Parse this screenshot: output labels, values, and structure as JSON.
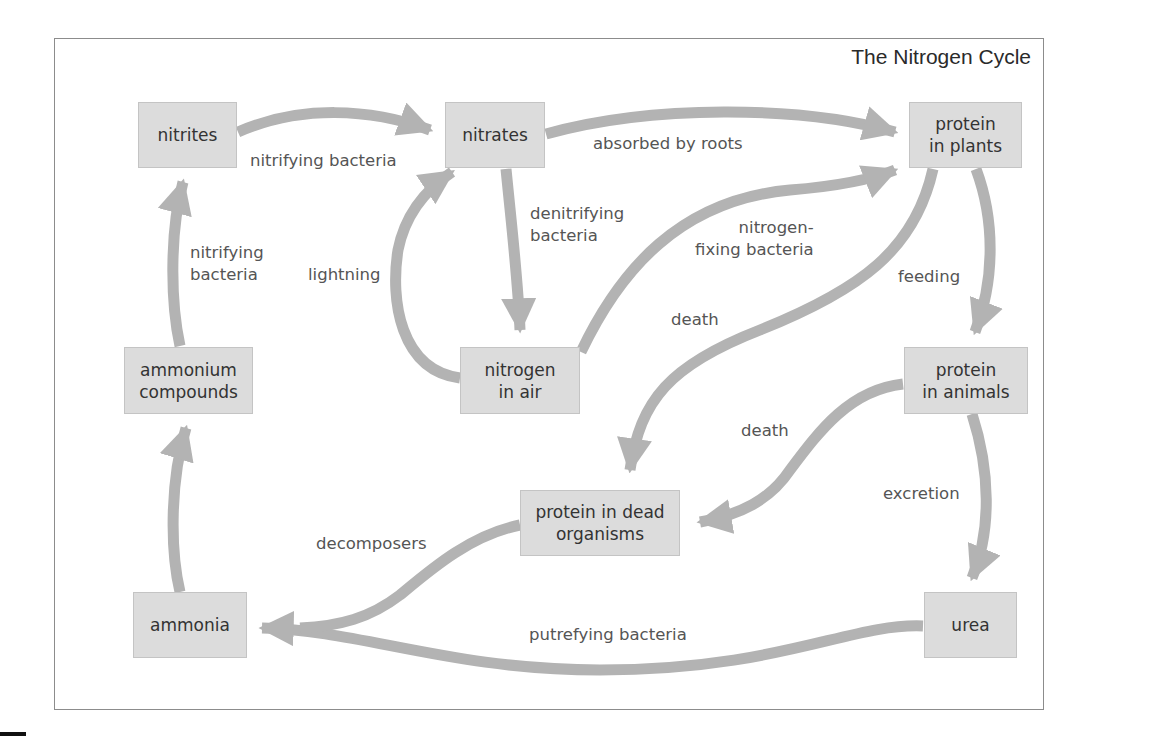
{
  "title": "The Nitrogen Cycle",
  "colors": {
    "arrow": "#b3b3b3",
    "box_fill": "#dcdcdc",
    "box_border": "#c4c4c4",
    "frame": "#8c8c8c",
    "text": "#333333",
    "label_text": "#555555"
  },
  "nodes": {
    "nitrites": "nitrites",
    "nitrates": "nitrates",
    "protein_in_plants": "protein\nin plants",
    "ammonium_compounds": "ammonium\ncompounds",
    "nitrogen_in_air": "nitrogen\nin air",
    "protein_in_animals": "protein\nin animals",
    "protein_in_dead_organisms": "protein in dead\norganisms",
    "ammonia": "ammonia",
    "urea": "urea"
  },
  "edges": {
    "nitrites_to_nitrates": "nitrifying bacteria",
    "nitrates_to_plants": "absorbed by roots",
    "nitrates_to_air": "denitrifying\nbacteria",
    "air_to_nitrates": "lightning",
    "air_to_plants": "nitrogen-\nfixing bacteria",
    "ammonium_to_nitrites": "nitrifying\nbacteria",
    "plants_to_animals": "feeding",
    "plants_to_dead": "death",
    "animals_to_dead": "death",
    "animals_to_urea": "excretion",
    "dead_to_ammonia": "decomposers",
    "urea_to_ammonia": "putrefying bacteria"
  }
}
